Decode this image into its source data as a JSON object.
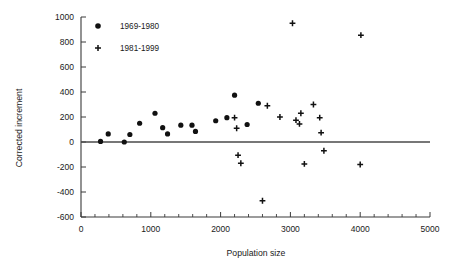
{
  "chart_data": {
    "type": "scatter",
    "title": "",
    "xlabel": "Population size",
    "ylabel": "Corrected increment",
    "xlim": [
      0,
      5000
    ],
    "ylim": [
      -600,
      1000
    ],
    "xticks": [
      0,
      1000,
      2000,
      3000,
      4000,
      5000
    ],
    "yticks": [
      -600,
      -400,
      -200,
      0,
      200,
      400,
      600,
      800,
      1000
    ],
    "xtick_labels": [
      "0",
      "1000",
      "2000",
      "3000",
      "4000",
      "5000"
    ],
    "ytick_labels": [
      "-600",
      "-400",
      "-200",
      "0",
      "200",
      "400",
      "600",
      "800",
      "1000"
    ],
    "grid": false,
    "legend_position": "top-left",
    "annotations": [
      {
        "kind": "hline",
        "y": 0,
        "label": "zero reference line"
      }
    ],
    "series": [
      {
        "name": "1969-1980",
        "marker": "circle",
        "color": "#111111",
        "points": [
          {
            "x": 280,
            "y": 5
          },
          {
            "x": 390,
            "y": 65
          },
          {
            "x": 620,
            "y": 0
          },
          {
            "x": 700,
            "y": 60
          },
          {
            "x": 840,
            "y": 150
          },
          {
            "x": 1060,
            "y": 230
          },
          {
            "x": 1170,
            "y": 115
          },
          {
            "x": 1240,
            "y": 65
          },
          {
            "x": 1430,
            "y": 135
          },
          {
            "x": 1590,
            "y": 135
          },
          {
            "x": 1640,
            "y": 85
          },
          {
            "x": 1930,
            "y": 170
          },
          {
            "x": 2090,
            "y": 195
          },
          {
            "x": 2200,
            "y": 375
          },
          {
            "x": 2380,
            "y": 140
          },
          {
            "x": 2540,
            "y": 310
          }
        ]
      },
      {
        "name": "1981-1999",
        "marker": "plus",
        "color": "#111111",
        "points": [
          {
            "x": 2200,
            "y": 195
          },
          {
            "x": 2230,
            "y": 110
          },
          {
            "x": 2250,
            "y": -105
          },
          {
            "x": 2290,
            "y": -170
          },
          {
            "x": 2600,
            "y": -470
          },
          {
            "x": 2670,
            "y": 290
          },
          {
            "x": 2850,
            "y": 200
          },
          {
            "x": 3030,
            "y": 950
          },
          {
            "x": 3080,
            "y": 175
          },
          {
            "x": 3130,
            "y": 145
          },
          {
            "x": 3150,
            "y": 230
          },
          {
            "x": 3200,
            "y": -175
          },
          {
            "x": 3330,
            "y": 300
          },
          {
            "x": 3420,
            "y": 195
          },
          {
            "x": 3440,
            "y": 75
          },
          {
            "x": 3480,
            "y": -70
          },
          {
            "x": 4010,
            "y": 855
          },
          {
            "x": 4000,
            "y": -180
          }
        ]
      }
    ]
  },
  "legend": {
    "entries": [
      {
        "label": "1969-1980",
        "marker": "circle"
      },
      {
        "label": "1981-1999",
        "marker": "plus"
      }
    ]
  }
}
